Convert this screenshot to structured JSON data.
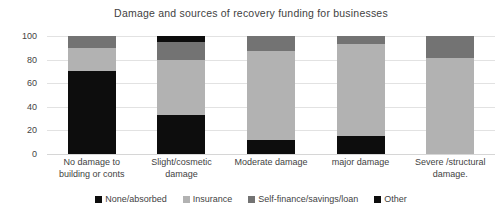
{
  "chart_data": {
    "type": "bar",
    "subtype": "stacked-bar-100",
    "title": "Damage and sources of recovery funding for businesses",
    "xlabel": "",
    "ylabel": "",
    "ylim": [
      0,
      100
    ],
    "yticks": [
      100,
      80,
      60,
      40,
      20,
      0
    ],
    "grid": true,
    "legend_position": "bottom",
    "categories": [
      "No damage to building or conts",
      "Slight/cosmetic damage",
      "Moderate damage",
      "major damage",
      "Severe  /structural damage."
    ],
    "category_lines": [
      [
        "No damage to",
        "building or conts"
      ],
      [
        "Slight/cosmetic",
        "damage"
      ],
      [
        "Moderate damage"
      ],
      [
        "major damage"
      ],
      [
        "Severe  /structural",
        "damage."
      ]
    ],
    "series": [
      {
        "name": "None/absorbed",
        "color": "#0d0d0d",
        "values": [
          70,
          33,
          12,
          15,
          0
        ]
      },
      {
        "name": "Insurance",
        "color": "#b2b2b2",
        "values": [
          20,
          47,
          75,
          78,
          81
        ]
      },
      {
        "name": "Self-finance/savings/loan",
        "color": "#737373",
        "values": [
          10,
          15,
          13,
          7,
          19
        ]
      },
      {
        "name": "Other",
        "color": "#0d0d0d",
        "values": [
          0,
          5,
          0,
          0,
          0
        ]
      }
    ]
  },
  "colors": {
    "background": "#ffffff",
    "text": "#3f3f3f",
    "gridline": "#e2e2e2",
    "axis": "#d6d6d6",
    "none_absorbed": "#0d0d0d",
    "insurance": "#b2b2b2",
    "self_finance": "#737373",
    "other": "#0d0d0d"
  }
}
